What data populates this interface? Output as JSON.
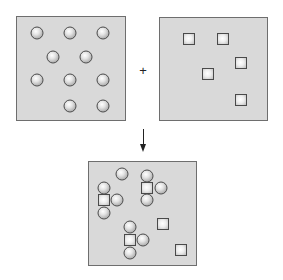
{
  "diagram": {
    "operator_plus": "+",
    "arrow": "down-arrow",
    "colors": {
      "panel_fill": "#d9d9d9",
      "panel_border": "#6e6e6e",
      "particle_outline": "#4a4a4a"
    },
    "panels": [
      {
        "name": "reactant-circles",
        "box": [
          16,
          16,
          126,
          121
        ],
        "circles": [
          [
            37,
            33
          ],
          [
            70,
            33
          ],
          [
            103,
            33
          ],
          [
            53,
            57
          ],
          [
            86,
            57
          ],
          [
            37,
            80
          ],
          [
            70,
            80
          ],
          [
            103,
            80
          ],
          [
            70,
            106
          ],
          [
            103,
            106
          ]
        ],
        "squares": []
      },
      {
        "name": "reactant-squares",
        "box": [
          159,
          17,
          268,
          121
        ],
        "circles": [],
        "squares": [
          [
            189,
            39
          ],
          [
            223,
            39
          ],
          [
            241,
            63
          ],
          [
            208,
            74
          ],
          [
            241,
            100
          ]
        ]
      },
      {
        "name": "product-mixture",
        "box": [
          88,
          161,
          197,
          266
        ],
        "circles": [
          [
            122,
            174
          ],
          [
            104,
            188
          ],
          [
            104,
            213
          ],
          [
            117,
            200
          ],
          [
            147,
            176
          ],
          [
            147,
            200
          ],
          [
            161,
            188
          ],
          [
            130,
            227
          ],
          [
            130,
            253
          ],
          [
            143,
            240
          ]
        ],
        "squares": [
          [
            104,
            200
          ],
          [
            147,
            188
          ],
          [
            130,
            240
          ],
          [
            163,
            224
          ],
          [
            181,
            250
          ]
        ]
      }
    ]
  }
}
